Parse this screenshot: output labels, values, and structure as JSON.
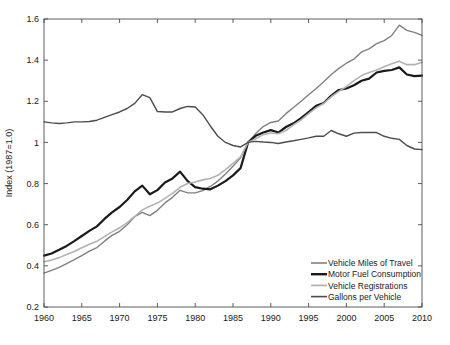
{
  "chart_data": {
    "type": "line",
    "title": "",
    "xlabel": "",
    "ylabel": "Index (1987=1.0)",
    "xlim": [
      1960,
      2010
    ],
    "ylim": [
      0.2,
      1.6
    ],
    "grid": false,
    "legend_position": "lower right",
    "xticks": [
      1960,
      1965,
      1970,
      1975,
      1980,
      1985,
      1990,
      1995,
      2000,
      2005,
      2010
    ],
    "xtick_labels": [
      "1960",
      "1965",
      "1970",
      "1975",
      "1980",
      "1985",
      "1990",
      "1995",
      "2000",
      "2005",
      "2010"
    ],
    "yticks": [
      0.2,
      0.4,
      0.6,
      0.8,
      1.0,
      1.2,
      1.4,
      1.6
    ],
    "ytick_labels": [
      "0.2",
      "0.4",
      "0.6",
      "0.8",
      "1",
      "1.2",
      "1.4",
      "1.6"
    ],
    "x": [
      1960,
      1961,
      1962,
      1963,
      1964,
      1965,
      1966,
      1967,
      1968,
      1969,
      1970,
      1971,
      1972,
      1973,
      1974,
      1975,
      1976,
      1977,
      1978,
      1979,
      1980,
      1981,
      1982,
      1983,
      1984,
      1985,
      1986,
      1987,
      1988,
      1989,
      1990,
      1991,
      1992,
      1993,
      1994,
      1995,
      1996,
      1997,
      1998,
      1999,
      2000,
      2001,
      2002,
      2003,
      2004,
      2005,
      2006,
      2007,
      2008,
      2009,
      2010
    ],
    "series": [
      {
        "name": "Vehicle Miles of Travel",
        "color": "#808080",
        "width": 1.4,
        "values": [
          0.365,
          0.378,
          0.393,
          0.411,
          0.43,
          0.45,
          0.472,
          0.489,
          0.52,
          0.548,
          0.568,
          0.6,
          0.639,
          0.66,
          0.644,
          0.67,
          0.706,
          0.733,
          0.767,
          0.755,
          0.755,
          0.766,
          0.786,
          0.812,
          0.847,
          0.884,
          0.925,
          1.0,
          1.043,
          1.077,
          1.097,
          1.104,
          1.14,
          1.17,
          1.2,
          1.232,
          1.262,
          1.295,
          1.33,
          1.36,
          1.385,
          1.405,
          1.44,
          1.455,
          1.48,
          1.495,
          1.52,
          1.57,
          1.545,
          1.535,
          1.52
        ]
      },
      {
        "name": "Motor Fuel Consumption",
        "color": "#1a1a1a",
        "width": 2.2,
        "values": [
          0.45,
          0.46,
          0.478,
          0.497,
          0.52,
          0.545,
          0.57,
          0.592,
          0.628,
          0.66,
          0.686,
          0.72,
          0.762,
          0.79,
          0.748,
          0.768,
          0.805,
          0.825,
          0.858,
          0.812,
          0.783,
          0.775,
          0.772,
          0.79,
          0.812,
          0.84,
          0.875,
          1.0,
          1.032,
          1.048,
          1.06,
          1.048,
          1.075,
          1.093,
          1.118,
          1.148,
          1.178,
          1.192,
          1.228,
          1.255,
          1.262,
          1.278,
          1.3,
          1.31,
          1.34,
          1.348,
          1.352,
          1.365,
          1.33,
          1.322,
          1.325
        ]
      },
      {
        "name": "Vehicle Registrations",
        "color": "#b3b3b3",
        "width": 1.6,
        "values": [
          0.42,
          0.428,
          0.44,
          0.455,
          0.47,
          0.488,
          0.505,
          0.52,
          0.542,
          0.565,
          0.585,
          0.61,
          0.64,
          0.672,
          0.69,
          0.705,
          0.728,
          0.752,
          0.782,
          0.8,
          0.808,
          0.818,
          0.825,
          0.84,
          0.868,
          0.898,
          0.93,
          1.0,
          1.018,
          1.038,
          1.046,
          1.042,
          1.058,
          1.085,
          1.11,
          1.14,
          1.168,
          1.19,
          1.222,
          1.248,
          1.272,
          1.3,
          1.325,
          1.34,
          1.352,
          1.368,
          1.382,
          1.395,
          1.378,
          1.378,
          1.39
        ]
      },
      {
        "name": "Gallons per Vehicle",
        "color": "#4d4d4d",
        "width": 1.4,
        "values": [
          1.1,
          1.095,
          1.092,
          1.095,
          1.1,
          1.1,
          1.102,
          1.108,
          1.122,
          1.135,
          1.148,
          1.165,
          1.19,
          1.232,
          1.218,
          1.15,
          1.148,
          1.148,
          1.165,
          1.175,
          1.172,
          1.135,
          1.08,
          1.03,
          1.0,
          0.985,
          0.978,
          1.0,
          1.005,
          1.002,
          1.0,
          0.995,
          1.002,
          1.008,
          1.015,
          1.022,
          1.03,
          1.03,
          1.058,
          1.042,
          1.03,
          1.045,
          1.048,
          1.048,
          1.048,
          1.03,
          1.02,
          1.015,
          0.985,
          0.968,
          0.965
        ]
      }
    ],
    "legend_entries": [
      {
        "label": "Vehicle Miles of Travel",
        "color": "#808080",
        "width": 1.6
      },
      {
        "label": "Motor Fuel Consumption",
        "color": "#1a1a1a",
        "width": 2.4
      },
      {
        "label": "Vehicle Registrations",
        "color": "#b3b3b3",
        "width": 1.8
      },
      {
        "label": "Gallons per Vehicle",
        "color": "#4d4d4d",
        "width": 1.6
      }
    ]
  }
}
